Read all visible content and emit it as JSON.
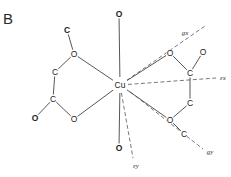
{
  "panel_label": "B",
  "metal_center": {
    "symbol": "Cu",
    "x": 120,
    "y": 85
  },
  "atoms": [
    {
      "id": "o_axial_top",
      "symbol": "O",
      "x": 119,
      "y": 14,
      "bold": true
    },
    {
      "id": "o_axial_bottom",
      "symbol": "O",
      "x": 119,
      "y": 148,
      "bold": true
    },
    {
      "id": "c_left_top",
      "symbol": "C",
      "x": 67,
      "y": 30,
      "bold": true
    },
    {
      "id": "o_left_upper",
      "symbol": "O",
      "x": 74,
      "y": 54,
      "bold": false
    },
    {
      "id": "c_left_mid",
      "symbol": "C",
      "x": 55,
      "y": 72,
      "bold": false
    },
    {
      "id": "c_left_low",
      "symbol": "C",
      "x": 53,
      "y": 99,
      "bold": false
    },
    {
      "id": "o_left_outer",
      "symbol": "O",
      "x": 35,
      "y": 118,
      "bold": true
    },
    {
      "id": "o_left_lower",
      "symbol": "O",
      "x": 74,
      "y": 119,
      "bold": false
    },
    {
      "id": "o_right_upper",
      "symbol": "O",
      "x": 170,
      "y": 53,
      "bold": false
    },
    {
      "id": "o_right_carbonyl",
      "symbol": "O",
      "x": 203,
      "y": 52,
      "bold": false
    },
    {
      "id": "c_right_upper",
      "symbol": "C",
      "x": 190,
      "y": 73,
      "bold": false
    },
    {
      "id": "c_right_lower",
      "symbol": "C",
      "x": 190,
      "y": 103,
      "bold": false
    },
    {
      "id": "o_right_lower",
      "symbol": "O",
      "x": 170,
      "y": 120,
      "bold": false
    },
    {
      "id": "c_right_tail",
      "symbol": "C",
      "x": 184,
      "y": 134,
      "bold": false
    }
  ],
  "bonds": [
    [
      "metal",
      "o_axial_top"
    ],
    [
      "metal",
      "o_axial_bottom"
    ],
    [
      "metal",
      "o_left_upper"
    ],
    [
      "metal",
      "o_left_lower"
    ],
    [
      "metal",
      "o_right_upper"
    ],
    [
      "metal",
      "o_right_lower"
    ],
    [
      "c_left_top",
      "o_left_upper"
    ],
    [
      "o_left_upper",
      "c_left_mid"
    ],
    [
      "c_left_mid",
      "c_left_low"
    ],
    [
      "c_left_low",
      "o_left_outer"
    ],
    [
      "c_left_low",
      "o_left_lower"
    ],
    [
      "o_right_upper",
      "c_right_upper"
    ],
    [
      "o_right_carbonyl",
      "c_right_upper"
    ],
    [
      "c_right_upper",
      "c_right_lower"
    ],
    [
      "c_right_lower",
      "o_right_lower"
    ],
    [
      "o_right_lower",
      "c_right_tail"
    ]
  ],
  "axes": [
    {
      "id": "gx",
      "label": "gx",
      "x1": 120,
      "y1": 85,
      "x2": 205,
      "y2": 26,
      "label_x": 185,
      "label_y": 33
    },
    {
      "id": "ex",
      "label": "εx",
      "x1": 120,
      "y1": 85,
      "x2": 216,
      "y2": 78,
      "label_x": 223,
      "label_y": 78
    },
    {
      "id": "ey",
      "label": "εy",
      "x1": 120,
      "y1": 85,
      "x2": 133,
      "y2": 158,
      "label_x": 136,
      "label_y": 166
    },
    {
      "id": "gy",
      "label": "gy",
      "x1": 124,
      "y1": 87,
      "x2": 203,
      "y2": 149,
      "label_x": 210,
      "label_y": 152
    }
  ],
  "labels": {
    "gx": "gx",
    "ex": "εx",
    "ey": "εy",
    "gy": "gy"
  }
}
